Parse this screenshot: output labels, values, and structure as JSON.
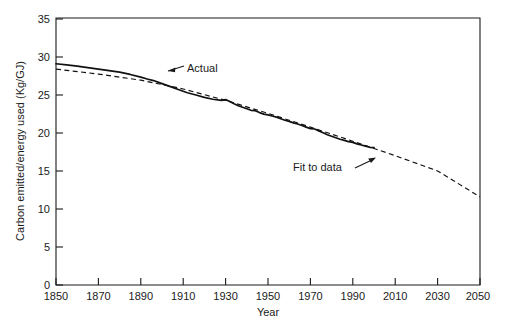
{
  "figure": {
    "background_color": "#ffffff",
    "ink_color": "#1a1a1a"
  },
  "chart_data": {
    "type": "line",
    "title": "",
    "xlabel": "Year",
    "ylabel": "Carbon emitted/energy used (Kg/GJ)",
    "xlim": [
      1850,
      2050
    ],
    "ylim": [
      0,
      35
    ],
    "xticks": [
      1850,
      1870,
      1890,
      1910,
      1930,
      1950,
      1970,
      1990,
      2010,
      2030,
      2050
    ],
    "yticks": [
      0,
      5,
      10,
      15,
      20,
      25,
      30,
      35
    ],
    "xtick_labels": [
      "1850",
      "1870",
      "1890",
      "1910",
      "1930",
      "1950",
      "1970",
      "1990",
      "2010",
      "2030",
      "2050"
    ],
    "ytick_labels": [
      "0",
      "5",
      "10",
      "15",
      "20",
      "25",
      "30",
      "35"
    ],
    "grid": false,
    "legend": "none",
    "annotations": [
      {
        "name": "actual",
        "text": "Actual",
        "text_x": 1922,
        "text_y": 28.2,
        "points_to_x": 1893,
        "points_to_y": 26.9
      },
      {
        "name": "fit-to-data",
        "text": "Fit to data",
        "text_x": 1963,
        "text_y": 17.1,
        "points_to_x": 1999,
        "points_to_y": 17.9
      }
    ],
    "series": [
      {
        "name": "Actual",
        "style": "solid",
        "x": [
          1850,
          1855,
          1860,
          1865,
          1870,
          1875,
          1880,
          1885,
          1890,
          1893,
          1896,
          1900,
          1904,
          1908,
          1912,
          1916,
          1920,
          1924,
          1928,
          1930,
          1932,
          1934,
          1936,
          1938,
          1940,
          1942,
          1944,
          1946,
          1948,
          1950,
          1952,
          1954,
          1956,
          1958,
          1960,
          1962,
          1964,
          1966,
          1968,
          1970,
          1972,
          1974,
          1976,
          1978,
          1980,
          1982,
          1984,
          1986,
          1988,
          1990,
          1992,
          1994,
          1996,
          1998,
          2000
        ],
        "values": [
          29.0,
          28.85,
          28.7,
          28.5,
          28.3,
          28.1,
          27.9,
          27.6,
          27.25,
          27.0,
          26.8,
          26.4,
          26.0,
          25.6,
          25.2,
          24.9,
          24.6,
          24.35,
          24.2,
          24.3,
          24.05,
          23.75,
          23.5,
          23.3,
          23.1,
          22.9,
          22.85,
          22.6,
          22.4,
          22.3,
          22.15,
          22.0,
          21.8,
          21.6,
          21.45,
          21.25,
          21.1,
          20.9,
          20.7,
          20.5,
          20.45,
          20.2,
          19.95,
          19.7,
          19.5,
          19.3,
          19.1,
          18.95,
          18.8,
          18.7,
          18.5,
          18.35,
          18.2,
          18.05,
          18.0
        ]
      },
      {
        "name": "Fit to data",
        "style": "dashed",
        "x": [
          1850,
          1870,
          1890,
          1910,
          1930,
          1950,
          1970,
          1990,
          2000,
          2010,
          2030,
          2050
        ],
        "values": [
          28.3,
          27.65,
          26.85,
          25.7,
          24.2,
          22.5,
          20.7,
          18.85,
          17.9,
          16.95,
          14.95,
          11.55
        ]
      }
    ]
  }
}
